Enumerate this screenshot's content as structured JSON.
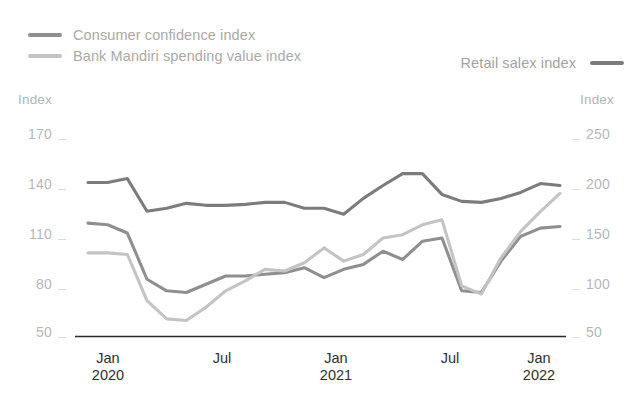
{
  "legend": {
    "left_items": [
      {
        "label": "Consumer confidence index",
        "color": "#8f8f8f",
        "key": "consumer_confidence"
      },
      {
        "label": "Bank Mandiri spending value index",
        "color": "#c4c4c4",
        "key": "bank_mandiri"
      }
    ],
    "right_items": [
      {
        "label": "Retail salex index",
        "color": "#7c7c7c",
        "key": "retail_sales"
      }
    ]
  },
  "axes": {
    "left_caption": "Index",
    "right_caption": "Index",
    "left_ticks": [
      "170",
      "140",
      "110",
      "80",
      "50"
    ],
    "right_ticks": [
      "250",
      "200",
      "150",
      "100",
      "50"
    ],
    "x_ticks": [
      {
        "month": "Jan",
        "year": "2020"
      },
      {
        "month": "Jul",
        "year": ""
      },
      {
        "month": "Jan",
        "year": "2021"
      },
      {
        "month": "Jul",
        "year": ""
      },
      {
        "month": "Jan",
        "year": "2022"
      }
    ]
  },
  "chart_data": {
    "type": "line",
    "title": "",
    "xlabel": "",
    "ylabel": "Index",
    "grid": false,
    "legend_position": "top",
    "x": [
      "Jan 2020",
      "Feb 2020",
      "Mar 2020",
      "Apr 2020",
      "May 2020",
      "Jun 2020",
      "Jul 2020",
      "Aug 2020",
      "Sep 2020",
      "Oct 2020",
      "Nov 2020",
      "Dec 2020",
      "Jan 2021",
      "Feb 2021",
      "Mar 2021",
      "Apr 2021",
      "May 2021",
      "Jun 2021",
      "Jul 2021",
      "Aug 2021",
      "Sep 2021",
      "Oct 2021",
      "Nov 2021",
      "Dec 2021",
      "Jan 2022"
    ],
    "axis_left": {
      "label": "Index",
      "min": 50,
      "max": 170,
      "tick_step": 30
    },
    "axis_right": {
      "label": "Index",
      "min": 50,
      "max": 250,
      "tick_step": 50
    },
    "series": [
      {
        "name": "Retail salex index",
        "key": "retail_sales",
        "axis": "right",
        "color": "#7c7c7c",
        "values": [
          206,
          206,
          210,
          177,
          180,
          185,
          183,
          183,
          184,
          186,
          186,
          180,
          180,
          174,
          190,
          203,
          215,
          215,
          194,
          187,
          186,
          190,
          196,
          205,
          203
        ]
      },
      {
        "name": "Consumer confidence index",
        "key": "consumer_confidence",
        "axis": "left",
        "color": "#8f8f8f",
        "values": [
          119,
          118,
          113,
          85,
          78,
          77,
          82,
          87,
          87,
          88,
          89,
          92,
          86,
          91,
          94,
          102,
          97,
          108,
          110,
          78,
          77,
          96,
          111,
          116,
          117
        ]
      },
      {
        "name": "Bank Mandiri spending value index",
        "key": "bank_mandiri",
        "axis": "left",
        "color": "#c4c4c4",
        "values": [
          101,
          101,
          100,
          72,
          61,
          60,
          68,
          78,
          84,
          91,
          90,
          95,
          104,
          96,
          100,
          110,
          112,
          118,
          121,
          81,
          76,
          98,
          114,
          126,
          137
        ]
      }
    ]
  }
}
